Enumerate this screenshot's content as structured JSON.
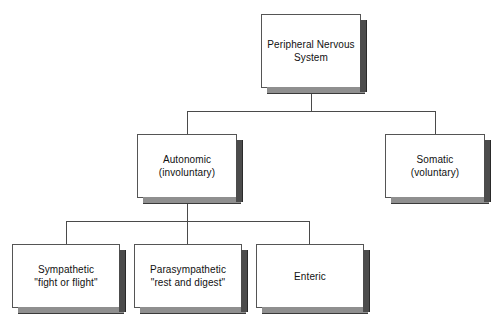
{
  "diagram": {
    "type": "hierarchy-tree",
    "colors": {
      "box_fill": "#ffffff",
      "box_border": "#555555",
      "shadow_right": "#4c4c4c",
      "shadow_bottom": "#8f8f8f",
      "connector": "#4a4a4a",
      "text": "#111111",
      "background": "#ffffff"
    },
    "nodes": {
      "root": {
        "label": "Peripheral Nervous\nSystem",
        "line1": "Peripheral Nervous",
        "line2": "System",
        "level": 0
      },
      "autonomic": {
        "label": "Autonomic\n(involuntary)",
        "line1": "Autonomic",
        "line2": "(involuntary)",
        "level": 1
      },
      "somatic": {
        "label": "Somatic\n(voluntary)",
        "line1": "Somatic",
        "line2": "(voluntary)",
        "level": 1
      },
      "sympathetic": {
        "label": "Sympathetic\n\"fight or flight\"",
        "line1": "Sympathetic",
        "line2": "\"fight or flight\"",
        "level": 2
      },
      "parasympathetic": {
        "label": "Parasympathetic\n\"rest and digest\"",
        "line1": "Parasympathetic",
        "line2": "\"rest and digest\"",
        "level": 2
      },
      "enteric": {
        "label": "Enteric",
        "line1": "Enteric",
        "line2": "",
        "level": 2
      }
    },
    "edges": [
      {
        "from": "root",
        "to": "autonomic"
      },
      {
        "from": "root",
        "to": "somatic"
      },
      {
        "from": "autonomic",
        "to": "sympathetic"
      },
      {
        "from": "autonomic",
        "to": "parasympathetic"
      },
      {
        "from": "autonomic",
        "to": "enteric"
      }
    ]
  }
}
